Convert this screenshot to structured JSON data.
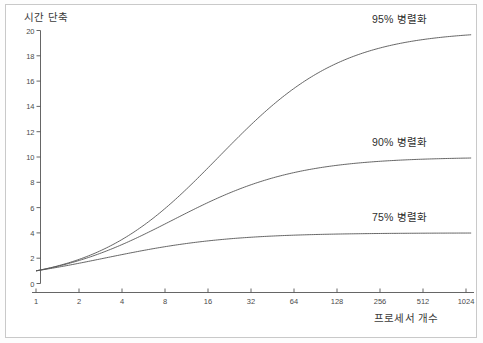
{
  "chart_data": {
    "type": "line",
    "title": "",
    "xlabel": "프로세서 개수",
    "ylabel": "시간 단축",
    "xscale": "log2",
    "x": [
      1,
      2,
      4,
      8,
      16,
      32,
      64,
      128,
      256,
      512,
      1024
    ],
    "xtick_labels": [
      "1",
      "2",
      "4",
      "8",
      "16",
      "32",
      "64",
      "128",
      "256",
      "512",
      "1024"
    ],
    "ytick_labels": [
      "0",
      "2",
      "4",
      "6",
      "8",
      "10",
      "12",
      "14",
      "16",
      "18",
      "20"
    ],
    "ytick_values": [
      0,
      2,
      4,
      6,
      8,
      10,
      12,
      14,
      16,
      18,
      20
    ],
    "ylim": [
      0,
      20
    ],
    "xlim": [
      1,
      1024
    ],
    "grid": false,
    "legend_position": "inline-right",
    "series": [
      {
        "name": "95% 병렬화",
        "parallel_fraction": 0.95,
        "color": "#555555",
        "label_x": 1024,
        "values": [
          1.0,
          1.9,
          3.48,
          5.93,
          9.14,
          12.55,
          15.42,
          17.41,
          18.62,
          19.29,
          19.64
        ]
      },
      {
        "name": "90% 병렬화",
        "parallel_fraction": 0.9,
        "color": "#555555",
        "label_x": 1024,
        "values": [
          1.0,
          1.82,
          3.08,
          4.71,
          6.4,
          7.8,
          8.77,
          9.34,
          9.66,
          9.83,
          9.91
        ]
      },
      {
        "name": "75% 병렬화",
        "parallel_fraction": 0.75,
        "color": "#555555",
        "label_x": 1024,
        "values": [
          1.0,
          1.6,
          2.29,
          2.91,
          3.37,
          3.66,
          3.82,
          3.91,
          3.95,
          3.98,
          3.99
        ]
      }
    ],
    "annotations": [
      {
        "text": "95% 병렬화",
        "near_series": "95% 병렬화"
      },
      {
        "text": "90% 병렬화",
        "near_series": "90% 병렬화"
      },
      {
        "text": "75% 병렬화",
        "near_series": "75% 병렬화"
      }
    ]
  },
  "colors": {
    "background": "#ffffff",
    "frame_border": "#c9c9c9",
    "axis_line": "#555555",
    "curve": "#555555",
    "text": "#3b3b3b",
    "tick_text": "#4a4a4a"
  }
}
